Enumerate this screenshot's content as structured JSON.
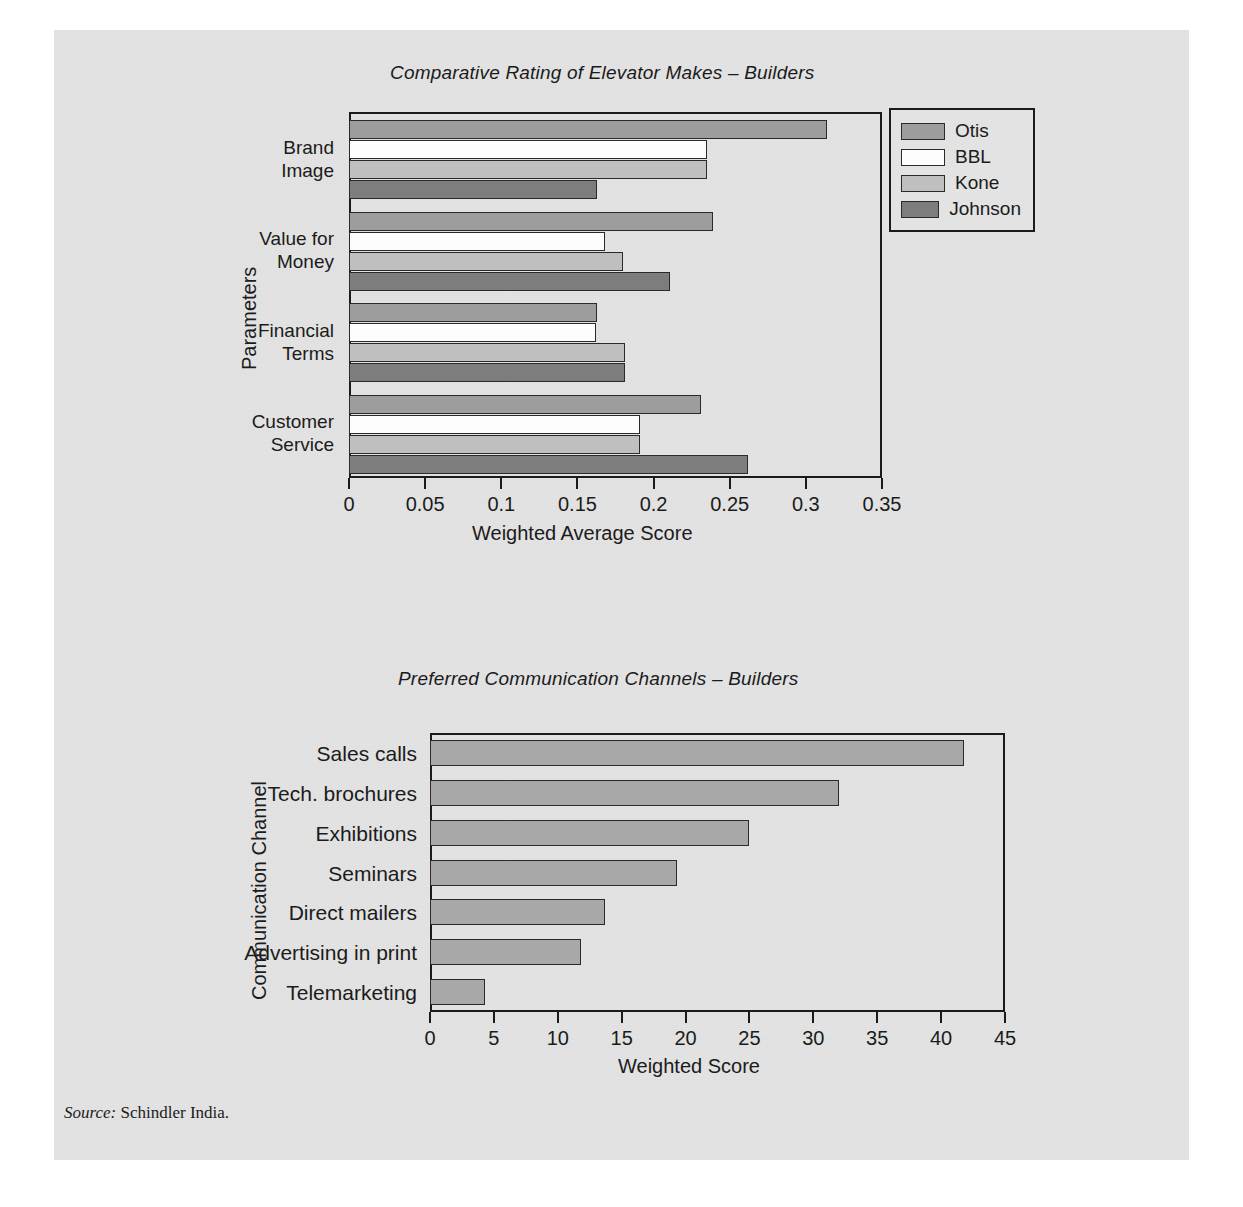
{
  "figure": {
    "source_prefix": "Source:",
    "source_text": "Schindler India."
  },
  "chart_data": [
    {
      "type": "bar",
      "orientation": "horizontal",
      "title": "Comparative Rating of Elevator Makes – Builders",
      "xlabel": "Weighted Average Score",
      "ylabel": "Parameters",
      "categories": [
        "Brand Image",
        "Value for Money",
        "Financial Terms",
        "Customer Service"
      ],
      "category_lines": [
        [
          "Brand",
          "Image"
        ],
        [
          "Value for",
          "Money"
        ],
        [
          "Financial",
          "Terms"
        ],
        [
          "Customer",
          "Service"
        ]
      ],
      "series": [
        {
          "name": "Otis",
          "color": "#9d9d9d",
          "values": [
            0.314,
            0.239,
            0.163,
            0.231
          ]
        },
        {
          "name": "BBL",
          "color": "#fdfdfd",
          "values": [
            0.235,
            0.168,
            0.162,
            0.191
          ]
        },
        {
          "name": "Kone",
          "color": "#bfbfbf",
          "values": [
            0.235,
            0.18,
            0.181,
            0.191
          ]
        },
        {
          "name": "Johnson",
          "color": "#7d7d7d",
          "values": [
            0.163,
            0.211,
            0.181,
            0.262
          ]
        }
      ],
      "xlim": [
        0,
        0.35
      ],
      "xticks": [
        0,
        0.05,
        0.1,
        0.15,
        0.2,
        0.25,
        0.3,
        0.35
      ],
      "xticklabels": [
        "0",
        "0.05",
        "0.1",
        "0.15",
        "0.2",
        "0.25",
        "0.3",
        "0.35"
      ],
      "grid": false,
      "legend_position": "upper right"
    },
    {
      "type": "bar",
      "orientation": "horizontal",
      "title": "Preferred Communication Channels – Builders",
      "xlabel": "Weighted Score",
      "ylabel": "Communication Channel",
      "categories": [
        "Sales calls",
        "Tech. brochures",
        "Exhibitions",
        "Seminars",
        "Direct mailers",
        "Advertising in print",
        "Telemarketing"
      ],
      "values": [
        41.8,
        32.0,
        25.0,
        19.3,
        13.7,
        11.8,
        4.3
      ],
      "bar_color": "#a8a8a8",
      "xlim": [
        0,
        45
      ],
      "xticks": [
        0,
        5,
        10,
        15,
        20,
        25,
        30,
        35,
        40,
        45
      ],
      "xticklabels": [
        "0",
        "5",
        "10",
        "15",
        "20",
        "25",
        "30",
        "35",
        "40",
        "45"
      ],
      "grid": false,
      "legend_position": "none"
    }
  ]
}
